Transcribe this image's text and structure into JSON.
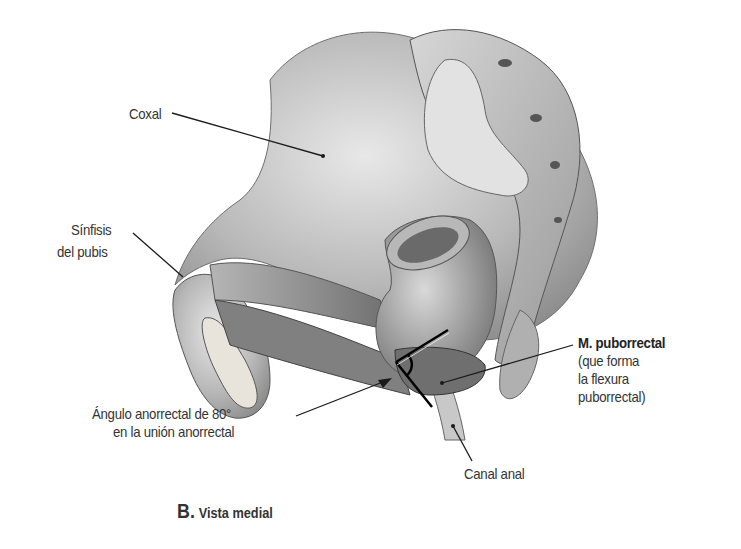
{
  "figure": {
    "caption": {
      "letter": "B.",
      "title": "Vista medial"
    },
    "labels": {
      "coxal": "Coxal",
      "sinfisis_line1": "Sínfisis",
      "sinfisis_line2": "del pubis",
      "puborrectal_title": "M. puborrectal",
      "puborrectal_line1": "(que forma",
      "puborrectal_line2": "la flexura",
      "puborrectal_line3": "puborrectal)",
      "angulo_line1": "Ángulo anorrectal de 80°",
      "angulo_line2": "en la unión anorrectal",
      "canal_anal": "Canal anal"
    },
    "colors": {
      "background": "#ffffff",
      "bone_light": "#e6e6e6",
      "bone_mid": "#bdbdbd",
      "bone_dark": "#7a7a7a",
      "muscle": "#8c8c8c",
      "leader_line": "#1a1a1a",
      "text": "#333333"
    }
  }
}
